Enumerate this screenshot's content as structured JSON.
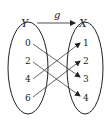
{
  "diagram": {
    "function_name": "g",
    "domain_set": {
      "name": "Y",
      "elements": [
        "0",
        "2",
        "4",
        "6"
      ]
    },
    "codomain_set": {
      "name": "X",
      "elements": [
        "1",
        "2",
        "3",
        "4"
      ]
    },
    "mappings": [
      {
        "from": "0",
        "to": "3"
      },
      {
        "from": "2",
        "to": "4"
      },
      {
        "from": "4",
        "to": "1"
      },
      {
        "from": "6",
        "to": "2"
      }
    ],
    "colors": {
      "stroke": "#222222",
      "background": "#ffffff"
    }
  }
}
